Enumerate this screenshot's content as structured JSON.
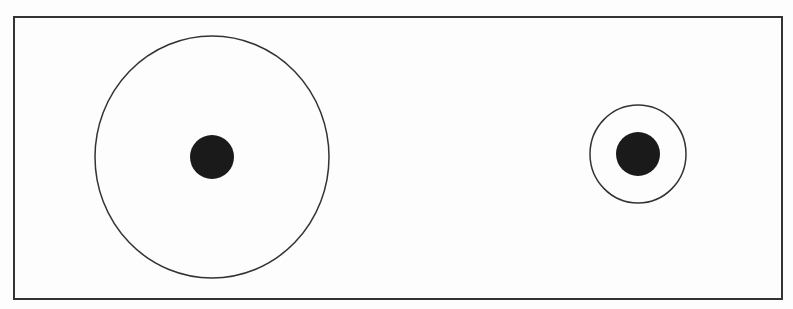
{
  "diagram": {
    "background": "#fdfdfd",
    "stroke_color": "#333333",
    "fill_color": "#1a1a1a",
    "frame": {
      "x": 14,
      "y": 17,
      "width": 768,
      "height": 282
    },
    "targets": [
      {
        "label": "large-ring",
        "cx": 212,
        "cy": 157,
        "ring_rx": 117,
        "ring_ry": 121,
        "dot_r": 22
      },
      {
        "label": "small-ring",
        "cx": 638,
        "cy": 154,
        "ring_rx": 48,
        "ring_ry": 49,
        "dot_r": 22
      }
    ]
  }
}
